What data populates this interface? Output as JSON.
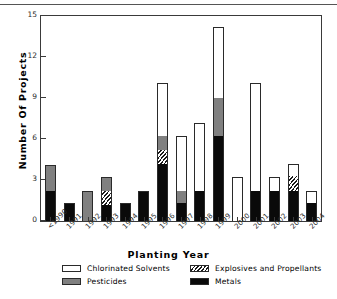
{
  "chart_data": {
    "type": "bar",
    "subtype": "stacked-vertical",
    "title": "",
    "xlabel": "Planting Year",
    "ylabel": "Number Of Projects",
    "categories": [
      "<1990",
      "1991",
      "1992",
      "1993",
      "1994",
      "1995",
      "1996",
      "1997",
      "1998",
      "1999",
      "2000",
      "2001",
      "2002",
      "2003",
      "2004"
    ],
    "series": [
      {
        "name": "Metals",
        "color": "#0a0a0a",
        "fill": "solid-black",
        "values": [
          2.2,
          1.3,
          0,
          1.2,
          1.3,
          2.2,
          4.2,
          1.3,
          2.2,
          6.2,
          0,
          2.2,
          2.2,
          2.2,
          1.3
        ]
      },
      {
        "name": "Explosives and Propellants",
        "color": "#ffffff",
        "fill": "diagonal-hatch",
        "values": [
          0,
          0,
          0,
          1.0,
          0,
          0,
          1.0,
          0,
          0,
          0,
          0,
          0,
          0,
          1.1,
          0
        ]
      },
      {
        "name": "Pesticides",
        "color": "#808080",
        "fill": "solid-gray",
        "values": [
          1.9,
          0,
          2.2,
          1.0,
          0,
          0,
          1.0,
          0.9,
          0,
          2.8,
          0,
          0,
          0,
          0,
          0
        ]
      },
      {
        "name": "Chlorinated Solvents",
        "color": "#ffffff",
        "fill": "solid-white",
        "values": [
          0,
          0,
          0,
          0,
          0,
          0,
          3.9,
          4.0,
          5.0,
          5.2,
          3.2,
          7.9,
          1.0,
          0.9,
          0.9
        ]
      }
    ],
    "stack_order": [
      "Metals",
      "Explosives and Propellants",
      "Pesticides",
      "Chlorinated Solvents"
    ],
    "totals": [
      4.1,
      1.3,
      2.2,
      3.2,
      1.3,
      2.2,
      10.1,
      6.2,
      7.2,
      14.2,
      3.2,
      10.1,
      3.2,
      4.2,
      2.2
    ],
    "ylim": [
      0,
      15
    ],
    "yticks": [
      0,
      3,
      6,
      9,
      12,
      15
    ],
    "ytick_labels": [
      "0",
      "3",
      "6",
      "9",
      "12",
      "15"
    ],
    "grid": false,
    "legend_position": "bottom"
  },
  "legend": {
    "entries": [
      {
        "label": "Chlorinated Solvents",
        "swatch": "solvents"
      },
      {
        "label": "Explosives and Propellants",
        "swatch": "explosives"
      },
      {
        "label": "Pesticides",
        "swatch": "pesticides"
      },
      {
        "label": "Metals",
        "swatch": "metals"
      }
    ]
  }
}
